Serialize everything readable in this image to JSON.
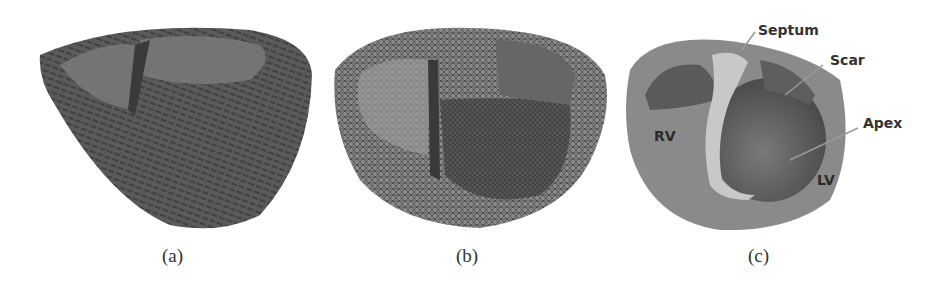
{
  "figure": {
    "panels": [
      {
        "id": "a",
        "caption": "(a)",
        "description": "Heart model with fiber orientation"
      },
      {
        "id": "b",
        "caption": "(b)",
        "description": "Heart tetrahedral mesh"
      },
      {
        "id": "c",
        "caption": "(c)",
        "description": "Heart model with labeled regions"
      }
    ],
    "labels": {
      "septum": "Septum",
      "scar": "Scar",
      "apex": "Apex",
      "rv": "RV",
      "lv": "LV"
    },
    "colors": {
      "tissue_dark": "#4a4a4a",
      "tissue_mid": "#6e6e6e",
      "tissue_light": "#8c8c8c",
      "septum_highlight": "#c8c8c8",
      "label_text": "#333333",
      "background": "#ffffff"
    }
  }
}
